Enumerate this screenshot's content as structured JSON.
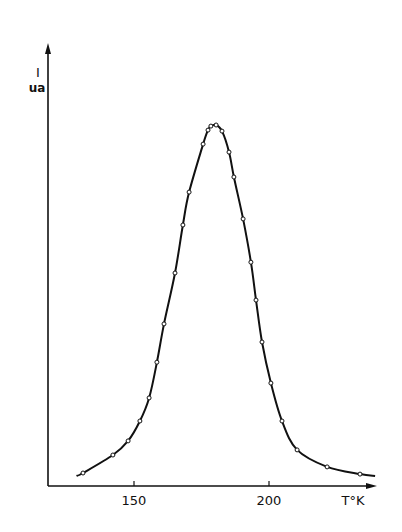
{
  "chart_data": {
    "type": "line",
    "title": "",
    "xlabel": "T°K",
    "ylabel": "I",
    "yunit": "ua",
    "xticks": [
      150,
      200
    ],
    "xlim": [
      123,
      237
    ],
    "ylim": [
      0,
      110
    ],
    "y_scale_note": "relative units, peak = 100 (no y ticks shown)",
    "grid": false,
    "legend": null,
    "series": [
      {
        "name": "measured points with fitted curve",
        "marker": "open-circle",
        "x": [
          131.1,
          142.2,
          147.8,
          152.2,
          155.6,
          158.5,
          161.1,
          165.2,
          168.1,
          170.4,
          175.6,
          177.4,
          178.5,
          180.4,
          182.6,
          185.2,
          187.0,
          190.4,
          193.3,
          195.2,
          197.4,
          200.7,
          204.8,
          210.4,
          221.5,
          233.7
        ],
        "y": [
          3.6,
          8.6,
          12.5,
          18.0,
          24.4,
          34.3,
          44.9,
          59.0,
          72.3,
          81.4,
          94.7,
          98.6,
          99.7,
          100,
          98.3,
          92.5,
          85.6,
          74.0,
          62.0,
          51.5,
          39.9,
          28.5,
          18.0,
          10.0,
          5.3,
          3.3
        ]
      }
    ],
    "curve_extent": {
      "x_start": 128.7,
      "x_end": 239.3,
      "y_start": 2.8,
      "y_end": 2.8
    }
  },
  "labels": {
    "y_symbol": "I",
    "y_unit": "ua",
    "x_tick_150": "150",
    "x_tick_200": "200",
    "x_label": "T°K"
  }
}
